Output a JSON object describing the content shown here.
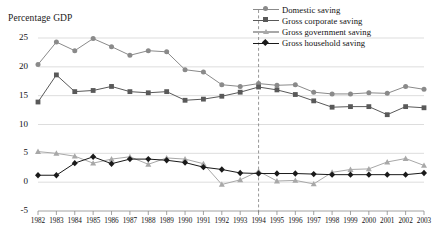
{
  "caption_clipped": "",
  "axis_title": "Percentage GDP",
  "colors": {
    "domestic": "#8a8a8a",
    "corporate": "#595959",
    "government": "#a8a8a8",
    "household": "#1a1a1a",
    "grid": "#d9d9d9",
    "axis": "#8c8c8c",
    "marker_event": "#7d7d7d"
  },
  "legend": {
    "items": [
      {
        "label": "Domestic saving",
        "marker": "circle",
        "color": "#8a8a8a"
      },
      {
        "label": "Gross corporate saving",
        "marker": "square",
        "color": "#595959"
      },
      {
        "label": "Gross government saving",
        "marker": "triangle",
        "color": "#a8a8a8"
      },
      {
        "label": "Gross household saving",
        "marker": "diamond",
        "color": "#1a1a1a"
      }
    ]
  },
  "chart_data": {
    "type": "line",
    "title": "",
    "xlabel": "",
    "ylabel": "Percentage GDP",
    "ylim": [
      -5,
      25
    ],
    "yticks": [
      -5,
      0,
      5,
      10,
      15,
      20,
      25
    ],
    "grid": true,
    "legend_position": "top-right",
    "x": [
      1982,
      1983,
      1984,
      1985,
      1986,
      1987,
      1988,
      1989,
      1990,
      1991,
      1992,
      1993,
      1994,
      1995,
      1996,
      1997,
      1998,
      1999,
      2000,
      2001,
      2002,
      2003
    ],
    "xticklabels": [
      "1982",
      "1983",
      "1984",
      "1985",
      "1986",
      "1987",
      "1988",
      "1989",
      "1990",
      "1991",
      "1992",
      "1993",
      "1994",
      "1995",
      "1996",
      "1997",
      "1998",
      "1999",
      "2000",
      "2001",
      "2002",
      "2003"
    ],
    "annotations": [
      {
        "type": "vline",
        "x": 1994,
        "style": "dashed",
        "color": "#7d7d7d"
      }
    ],
    "series": [
      {
        "name": "Domestic saving",
        "marker": "circle",
        "color": "#8a8a8a",
        "values": [
          20.4,
          24.3,
          22.8,
          24.9,
          23.5,
          22.0,
          22.8,
          22.6,
          19.5,
          19.1,
          16.9,
          16.6,
          17.1,
          16.8,
          16.9,
          15.6,
          15.3,
          15.3,
          15.5,
          15.4,
          16.6,
          16.1
        ]
      },
      {
        "name": "Gross corporate saving",
        "marker": "square",
        "color": "#595959",
        "values": [
          13.9,
          18.6,
          15.7,
          15.9,
          16.6,
          15.7,
          15.5,
          15.7,
          14.2,
          14.4,
          14.9,
          15.6,
          16.5,
          16.0,
          15.2,
          14.1,
          13.0,
          13.1,
          13.1,
          11.7,
          13.1,
          12.9
        ]
      },
      {
        "name": "Gross government saving",
        "marker": "triangle",
        "color": "#a8a8a8",
        "values": [
          5.3,
          5.0,
          4.5,
          3.3,
          4.0,
          4.4,
          3.1,
          4.2,
          4.0,
          3.2,
          -0.4,
          0.4,
          1.9,
          0.2,
          0.3,
          -0.3,
          1.7,
          2.2,
          2.3,
          3.5,
          4.1,
          2.9
        ]
      },
      {
        "name": "Gross household saving",
        "marker": "diamond",
        "color": "#1a1a1a",
        "values": [
          1.2,
          1.2,
          3.3,
          4.4,
          3.2,
          4.0,
          4.0,
          3.8,
          3.4,
          2.6,
          2.2,
          1.6,
          1.5,
          1.5,
          1.5,
          1.4,
          1.3,
          1.3,
          1.3,
          1.3,
          1.3,
          1.6
        ]
      }
    ]
  }
}
